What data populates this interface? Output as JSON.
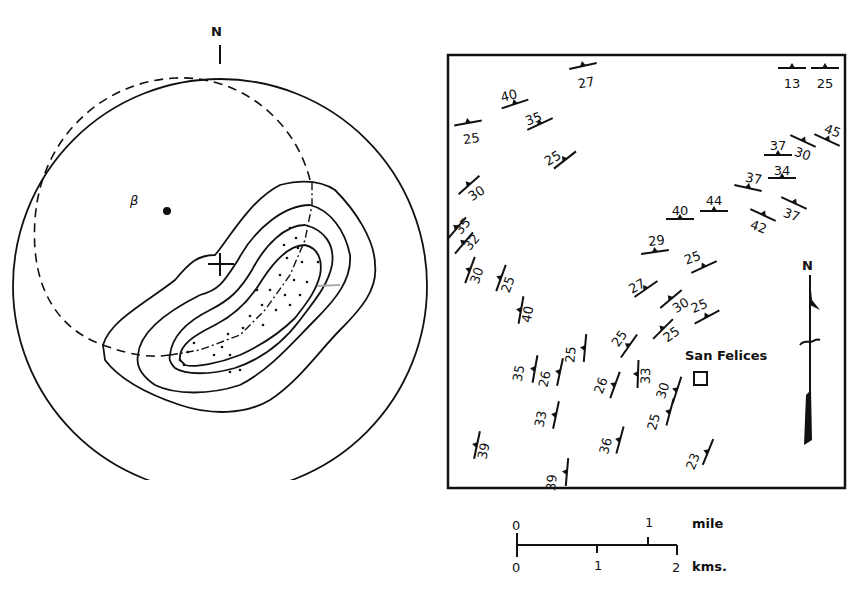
{
  "stereonet": {
    "north_label": "N",
    "beta_label": "β",
    "center_marker": "+",
    "contours": 4,
    "great_circle": "dashed",
    "axis_trace": "dash-dot"
  },
  "map": {
    "town_label": "San Felices",
    "north_label": "N",
    "dip_symbols": [
      {
        "dip": "27",
        "x": 583,
        "y": 66,
        "angle": -12,
        "tx": 587,
        "ty": 82
      },
      {
        "dip": "40",
        "x": 515,
        "y": 104,
        "angle": -18,
        "tx": 510,
        "ty": 95
      },
      {
        "dip": "25",
        "x": 468,
        "y": 123,
        "angle": -10,
        "tx": 472,
        "ty": 138
      },
      {
        "dip": "35",
        "x": 540,
        "y": 124,
        "angle": -25,
        "tx": 535,
        "ty": 118
      },
      {
        "dip": "25",
        "x": 565,
        "y": 160,
        "angle": -38,
        "tx": 555,
        "ty": 157
      },
      {
        "dip": "30",
        "x": 469,
        "y": 185,
        "angle": -42,
        "tx": 479,
        "ty": 192
      },
      {
        "dip": "13",
        "x": 792,
        "y": 68,
        "angle": 0,
        "tx": 792,
        "ty": 83
      },
      {
        "dip": "25",
        "x": 825,
        "y": 68,
        "angle": 0,
        "tx": 825,
        "ty": 83
      },
      {
        "dip": "45",
        "x": 827,
        "y": 140,
        "angle": 25,
        "tx": 831,
        "ty": 130
      },
      {
        "dip": "30",
        "x": 803,
        "y": 141,
        "angle": 25,
        "tx": 801,
        "ty": 153
      },
      {
        "dip": "37",
        "x": 778,
        "y": 155,
        "angle": 0,
        "tx": 778,
        "ty": 145
      },
      {
        "dip": "34",
        "x": 782,
        "y": 178,
        "angle": 0,
        "tx": 782,
        "ty": 170
      },
      {
        "dip": "37",
        "x": 748,
        "y": 188,
        "angle": 12,
        "tx": 753,
        "ty": 178
      },
      {
        "dip": "37",
        "x": 794,
        "y": 203,
        "angle": 25,
        "tx": 790,
        "ty": 214
      },
      {
        "dip": "42",
        "x": 763,
        "y": 215,
        "angle": 25,
        "tx": 757,
        "ty": 226
      },
      {
        "dip": "44",
        "x": 714,
        "y": 211,
        "angle": 0,
        "tx": 714,
        "ty": 200
      },
      {
        "dip": "40",
        "x": 680,
        "y": 219,
        "angle": 0,
        "tx": 680,
        "ty": 210
      },
      {
        "dip": "29",
        "x": 655,
        "y": 252,
        "angle": -8,
        "tx": 657,
        "ty": 240
      },
      {
        "dip": "25",
        "x": 704,
        "y": 267,
        "angle": -25,
        "tx": 694,
        "ty": 257
      },
      {
        "dip": "35",
        "x": 457,
        "y": 228,
        "angle": -50,
        "tx": 466,
        "ty": 224
      },
      {
        "dip": "32",
        "x": 464,
        "y": 243,
        "angle": -50,
        "tx": 475,
        "ty": 240
      },
      {
        "dip": "30",
        "x": 470,
        "y": 270,
        "angle": -70,
        "tx": 481,
        "ty": 272
      },
      {
        "dip": "25",
        "x": 501,
        "y": 278,
        "angle": -70,
        "tx": 512,
        "ty": 281
      },
      {
        "dip": "40",
        "x": 521,
        "y": 310,
        "angle": -80,
        "tx": 532,
        "ty": 310
      },
      {
        "dip": "27",
        "x": 646,
        "y": 289,
        "angle": -35,
        "tx": 639,
        "ty": 285
      },
      {
        "dip": "30",
        "x": 671,
        "y": 299,
        "angle": -40,
        "tx": 683,
        "ty": 304
      },
      {
        "dip": "25",
        "x": 707,
        "y": 317,
        "angle": -28,
        "tx": 701,
        "ty": 305
      },
      {
        "dip": "25",
        "x": 629,
        "y": 346,
        "angle": -55,
        "tx": 623,
        "ty": 336
      },
      {
        "dip": "25",
        "x": 663,
        "y": 329,
        "angle": -45,
        "tx": 674,
        "ty": 333
      },
      {
        "dip": "25",
        "x": 585,
        "y": 348,
        "angle": -85,
        "tx": 575,
        "ty": 350
      },
      {
        "dip": "35",
        "x": 535,
        "y": 369,
        "angle": -80,
        "tx": 523,
        "ty": 369
      },
      {
        "dip": "26",
        "x": 560,
        "y": 372,
        "angle": -78,
        "tx": 549,
        "ty": 375
      },
      {
        "dip": "26",
        "x": 615,
        "y": 385,
        "angle": -70,
        "tx": 605,
        "ty": 382
      },
      {
        "dip": "33",
        "x": 638,
        "y": 374,
        "angle": -88,
        "tx": 650,
        "ty": 371
      },
      {
        "dip": "30",
        "x": 677,
        "y": 390,
        "angle": -72,
        "tx": 667,
        "ty": 387
      },
      {
        "dip": "33",
        "x": 556,
        "y": 415,
        "angle": -78,
        "tx": 545,
        "ty": 415
      },
      {
        "dip": "25",
        "x": 670,
        "y": 412,
        "angle": -75,
        "tx": 658,
        "ty": 418
      },
      {
        "dip": "39",
        "x": 477,
        "y": 445,
        "angle": -78,
        "tx": 488,
        "ty": 447
      },
      {
        "dip": "36",
        "x": 620,
        "y": 440,
        "angle": -75,
        "tx": 610,
        "ty": 442
      },
      {
        "dip": "23",
        "x": 708,
        "y": 452,
        "angle": -68,
        "tx": 697,
        "ty": 458
      },
      {
        "dip": "39",
        "x": 567,
        "y": 472,
        "angle": -85,
        "tx": 556,
        "ty": 478
      }
    ]
  },
  "scale_bar": {
    "mile_labels": [
      "0",
      "1"
    ],
    "mile_unit": "mile",
    "km_labels": [
      "0",
      "1",
      "2"
    ],
    "km_unit": "kms."
  }
}
